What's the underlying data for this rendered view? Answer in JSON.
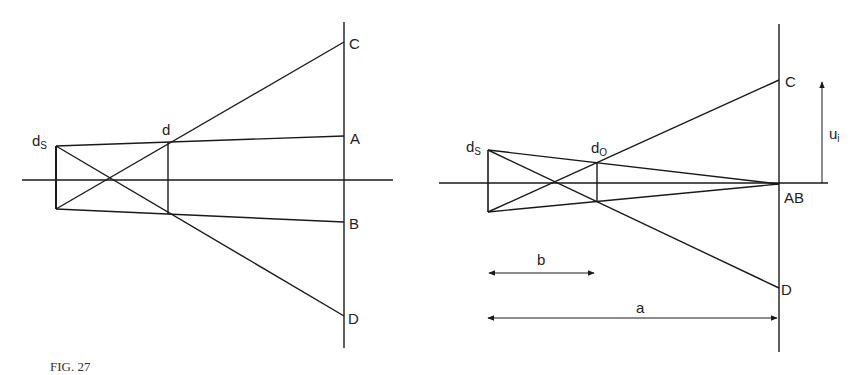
{
  "figure": {
    "caption": "FIG. 27",
    "left_diagram": {
      "labels": {
        "source": "d",
        "source_sub": "S",
        "lens": "d",
        "C": "C",
        "A": "A",
        "B": "B",
        "D": "D"
      }
    },
    "right_diagram": {
      "labels": {
        "source": "d",
        "source_sub": "S",
        "lens": "d",
        "lens_sub": "O",
        "C": "C",
        "AB": "AB",
        "D": "D",
        "u": "u",
        "u_sub": "i",
        "b": "b",
        "a": "a"
      }
    },
    "colors": {
      "line": "#1a1a1a",
      "background": "#ffffff"
    }
  }
}
